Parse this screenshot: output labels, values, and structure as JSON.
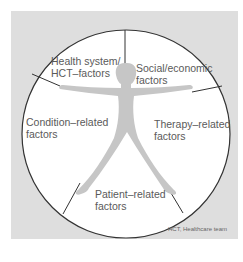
{
  "diagram": {
    "type": "segmented-circle-with-figure",
    "segments": [
      {
        "id": "health-system",
        "label_line1": "Health system/",
        "label_line2": "HCT–factors"
      },
      {
        "id": "social-economic",
        "label_line1": "Social/economic",
        "label_line2": "factors"
      },
      {
        "id": "therapy",
        "label_line1": "Therapy–related",
        "label_line2": "factors"
      },
      {
        "id": "patient",
        "label_line1": "Patient–related",
        "label_line2": "factors"
      },
      {
        "id": "condition",
        "label_line1": "Condition–related",
        "label_line2": "factors"
      }
    ],
    "footnote": "HCT, Healthcare team",
    "colors": {
      "background": "#dedede",
      "circle_fill": "#ffffff",
      "figure_fill": "#c6c6c6",
      "line": "#333333",
      "text": "#5a5a5a"
    }
  }
}
